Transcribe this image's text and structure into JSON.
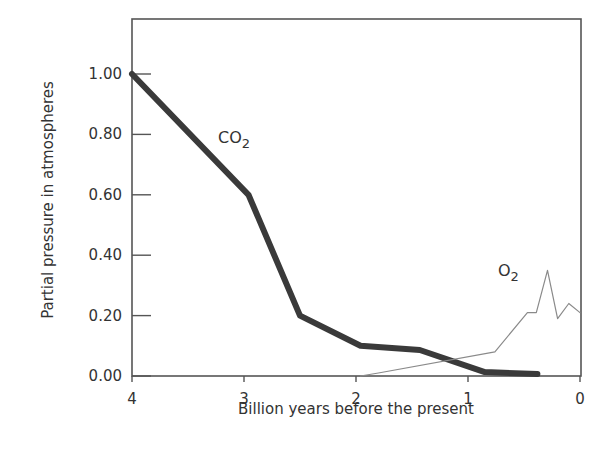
{
  "chart_data": {
    "type": "line",
    "title": "",
    "xlabel": "Billion years before the present",
    "ylabel": "Partial pressure in atmospheres",
    "xlim": [
      4,
      0
    ],
    "ylim": [
      0,
      1.18
    ],
    "x_reversed": true,
    "grid": false,
    "legend": "inline labels",
    "x_ticks": [
      "4",
      "3",
      "2",
      "1",
      "0"
    ],
    "y_ticks": [
      "0.00",
      "0.20",
      "0.40",
      "0.60",
      "0.80",
      "1.00"
    ],
    "series": [
      {
        "name": "CO2",
        "label_main": "CO",
        "label_sub": "2",
        "style": "thick dark",
        "color": "#3a3a3a",
        "x": [
          4.0,
          2.96,
          2.5,
          1.96,
          1.43,
          0.85,
          0.38
        ],
        "y": [
          1.0,
          0.6,
          0.2,
          0.1,
          0.086,
          0.013,
          0.007
        ]
      },
      {
        "name": "O2",
        "label_main": "O",
        "label_sub": "2",
        "style": "thin gray",
        "color": "#8a8a8a",
        "x": [
          1.96,
          1.8,
          0.76,
          0.47,
          0.39,
          0.29,
          0.2,
          0.1,
          0.0
        ],
        "y": [
          0.0,
          0.01,
          0.08,
          0.21,
          0.21,
          0.35,
          0.19,
          0.24,
          0.21
        ]
      }
    ]
  }
}
